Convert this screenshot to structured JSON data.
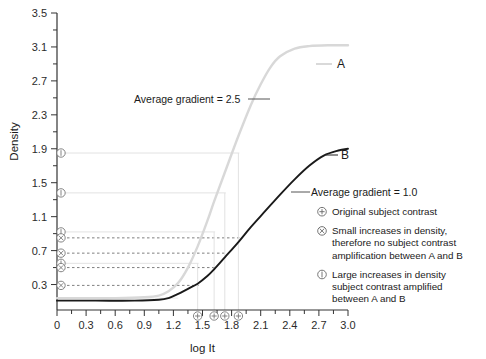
{
  "chart_data": {
    "type": "line",
    "title": "",
    "xlabel": "log It",
    "ylabel": "Density",
    "xlim": [
      0,
      3.0
    ],
    "ylim": [
      0.0,
      3.5
    ],
    "grid": false,
    "legend_position": "right",
    "x_ticks": [
      "0",
      "0.3",
      "0.6",
      "0.9",
      "1.2",
      "1.5",
      "1.8",
      "2.1",
      "2.4",
      "2.7",
      "3.0"
    ],
    "x_tick_values": [
      0,
      0.3,
      0.6,
      0.9,
      1.2,
      1.5,
      1.8,
      2.1,
      2.4,
      2.7,
      3.0
    ],
    "x_minor_step": 0.15,
    "y_ticks": [
      "0.3",
      "0.7",
      "1.1",
      "1.5",
      "1.9",
      "2.3",
      "2.7",
      "3.1",
      "3.5"
    ],
    "y_tick_values": [
      0.3,
      0.7,
      1.1,
      1.5,
      1.9,
      2.3,
      2.7,
      3.1,
      3.5
    ],
    "y_minor_step": 0.2,
    "series": [
      {
        "name": "A",
        "label": "A",
        "color": "#d8d8d8",
        "average_gradient": 2.5,
        "annotation": "Average gradient = 2.5",
        "base_density": 0.14,
        "max_density": 3.12,
        "toe": 1.05,
        "shoulder": 2.35,
        "points": [
          [
            0.0,
            0.14
          ],
          [
            0.3,
            0.14
          ],
          [
            0.6,
            0.14
          ],
          [
            0.9,
            0.15
          ],
          [
            1.05,
            0.17
          ],
          [
            1.15,
            0.22
          ],
          [
            1.25,
            0.32
          ],
          [
            1.35,
            0.5
          ],
          [
            1.45,
            0.75
          ],
          [
            1.55,
            1.05
          ],
          [
            1.62,
            1.28
          ],
          [
            1.73,
            1.62
          ],
          [
            1.87,
            2.05
          ],
          [
            2.0,
            2.42
          ],
          [
            2.1,
            2.66
          ],
          [
            2.2,
            2.86
          ],
          [
            2.3,
            2.99
          ],
          [
            2.45,
            3.08
          ],
          [
            2.6,
            3.11
          ],
          [
            2.8,
            3.12
          ],
          [
            3.0,
            3.12
          ]
        ]
      },
      {
        "name": "B",
        "label": "B",
        "color": "#1a1a1a",
        "average_gradient": 1.0,
        "annotation": "Average gradient = 1.0",
        "base_density": 0.11,
        "max_density": 1.9,
        "toe": 1.15,
        "shoulder": 2.75,
        "points": [
          [
            0.0,
            0.11
          ],
          [
            0.4,
            0.11
          ],
          [
            0.8,
            0.11
          ],
          [
            1.05,
            0.12
          ],
          [
            1.15,
            0.14
          ],
          [
            1.25,
            0.19
          ],
          [
            1.35,
            0.25
          ],
          [
            1.45,
            0.31
          ],
          [
            1.55,
            0.4
          ],
          [
            1.62,
            0.48
          ],
          [
            1.73,
            0.62
          ],
          [
            1.87,
            0.8
          ],
          [
            2.0,
            0.98
          ],
          [
            2.15,
            1.17
          ],
          [
            2.3,
            1.36
          ],
          [
            2.45,
            1.54
          ],
          [
            2.6,
            1.7
          ],
          [
            2.75,
            1.82
          ],
          [
            2.9,
            1.88
          ],
          [
            3.0,
            1.9
          ]
        ]
      }
    ],
    "subject_contrast_points": [
      {
        "x": 1.45,
        "density_a": 0.55,
        "density_b": 0.29
      },
      {
        "x": 1.62,
        "density_a": 0.92,
        "density_b": 0.5
      },
      {
        "x": 1.73,
        "density_a": 1.38,
        "density_b": 0.67
      },
      {
        "x": 1.87,
        "density_a": 1.85,
        "density_b": 0.85
      }
    ],
    "annotations": [
      {
        "id": "grad-a",
        "text": "Average gradient = 2.5",
        "x": 1.35,
        "y": 2.48
      },
      {
        "id": "grad-b",
        "text": "Average gradient = 1.0",
        "x": 2.2,
        "y": 1.52
      }
    ]
  },
  "legend": {
    "items": [
      {
        "symbol": "⊕",
        "symbol_name": "circled-plus",
        "lines": [
          "Original subject contrast"
        ]
      },
      {
        "symbol": "⊗",
        "symbol_name": "circled-times",
        "lines": [
          "Small increases in density,",
          "therefore no subject contrast",
          "amplification between A and B"
        ]
      },
      {
        "symbol": "①",
        "symbol_name": "circled-bar",
        "lines": [
          "Large increases in density",
          "subject contrast amplified",
          "between A and B"
        ]
      }
    ]
  }
}
